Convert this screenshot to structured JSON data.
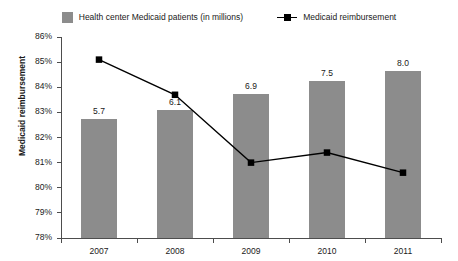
{
  "legend": {
    "items": [
      {
        "label": "Health center Medicaid patients (in millions)",
        "marker": "bar-swatch-icon",
        "color": "#8c8c8c"
      },
      {
        "label": "Medicaid reimbursement",
        "marker": "line-marker-icon",
        "color": "#000000"
      }
    ]
  },
  "axis": {
    "y_title": "Medicaid reimbursement",
    "y_ticks": [
      "86%",
      "85%",
      "84%",
      "83%",
      "82%",
      "81%",
      "80%",
      "79%",
      "78%"
    ],
    "x_ticks": [
      "2007",
      "2008",
      "2009",
      "2010",
      "2011"
    ]
  },
  "bar_labels": [
    "5.7",
    "6.1",
    "6.9",
    "7.5",
    "8.0"
  ],
  "chart_data": {
    "type": "bar",
    "title": "",
    "subtitle": "",
    "xlabel": "",
    "ylabel": "Medicaid reimbursement",
    "categories": [
      "2007",
      "2008",
      "2009",
      "2010",
      "2011"
    ],
    "grid": false,
    "legend_position": "top-center",
    "series": [
      {
        "name": "Health center Medicaid patients (in millions)",
        "type": "bar",
        "color": "#8c8c8c",
        "axis": "secondary",
        "values": [
          5.7,
          6.1,
          6.9,
          7.5,
          8.0
        ],
        "data_labels": [
          "5.7",
          "6.1",
          "6.9",
          "7.5",
          "8.0"
        ],
        "ylim": [
          0,
          9.6
        ]
      },
      {
        "name": "Medicaid reimbursement",
        "type": "line",
        "color": "#000000",
        "marker": "square",
        "axis": "primary",
        "values": [
          85.1,
          83.7,
          81.0,
          81.4,
          80.6
        ],
        "unit": "%"
      }
    ],
    "ylim": [
      78,
      86
    ],
    "ytick_values": [
      86,
      85,
      84,
      83,
      82,
      81,
      80,
      79,
      78
    ],
    "ytick_labels": [
      "86%",
      "85%",
      "84%",
      "83%",
      "82%",
      "81%",
      "80%",
      "79%",
      "78%"
    ]
  }
}
